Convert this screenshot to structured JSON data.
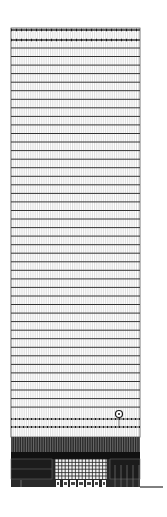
{
  "drawing": {
    "type": "building-elevation",
    "tower": {
      "left": 11,
      "right": 140,
      "top": 28,
      "shaft_bottom": 437,
      "base_bottom": 487
    },
    "top_bands": [
      30,
      40
    ],
    "floor_line_start": 48,
    "floor_line_spacing": 8.55,
    "floor_line_end": 412,
    "dotted_bands": [
      419,
      427
    ],
    "mullion_spacing": 2.2,
    "clock_symbol": {
      "cx": 119,
      "cy": 414,
      "r": 3.5
    },
    "ground_line": {
      "x1": 140,
      "x2": 163,
      "y": 487
    },
    "colors": {
      "line": "#333333",
      "light": "#b8b8b8",
      "dark": "#1a1a1a",
      "mid": "#555555",
      "bg": "#ffffff"
    }
  }
}
